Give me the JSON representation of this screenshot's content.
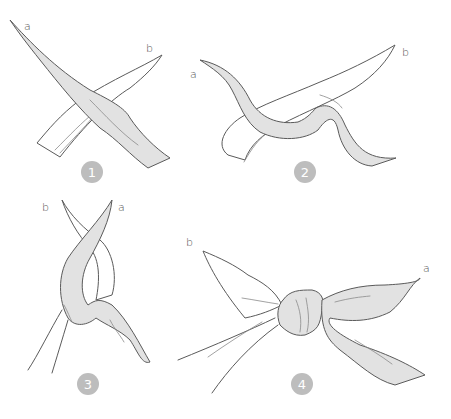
{
  "colors": {
    "scarf_fill": "#e2e2e2",
    "outline": "#5a5a5a",
    "badge": "#bdbdbd",
    "badge_text": "#ffffff"
  },
  "steps": [
    {
      "number": "1",
      "labels": {
        "a": "a",
        "b": "b"
      }
    },
    {
      "number": "2",
      "labels": {
        "a": "a",
        "b": "b"
      }
    },
    {
      "number": "3",
      "labels": {
        "a": "a",
        "b": "b"
      }
    },
    {
      "number": "4",
      "labels": {
        "a": "a",
        "b": "b"
      }
    }
  ]
}
